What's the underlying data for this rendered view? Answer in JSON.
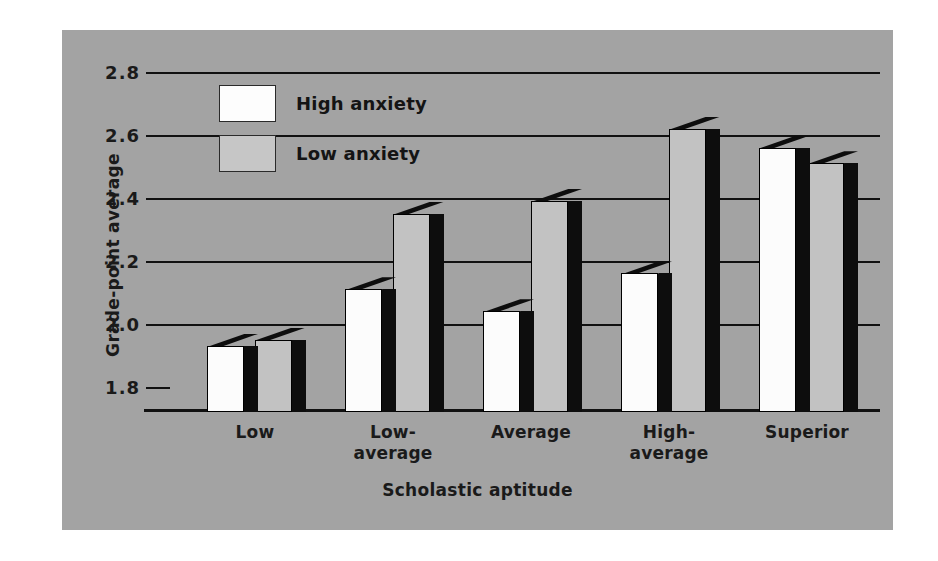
{
  "chart_data": {
    "type": "bar",
    "title": "",
    "xlabel": "Scholastic aptitude",
    "ylabel": "Grade-point average",
    "categories": [
      "Low",
      "Low-\naverage",
      "Average",
      "High-\naverage",
      "Superior"
    ],
    "series": [
      {
        "name": "High anxiety",
        "color": "#fcfcfc",
        "values": [
          1.93,
          2.11,
          2.04,
          2.16,
          2.56
        ]
      },
      {
        "name": "Low anxiety",
        "color": "#c2c2c2",
        "values": [
          1.95,
          2.35,
          2.39,
          2.62,
          2.51
        ]
      }
    ],
    "yticks": [
      "1.8",
      "2.0",
      "2.2",
      "2.4",
      "2.6",
      "2.8"
    ],
    "ytick_values": [
      1.8,
      2.0,
      2.2,
      2.4,
      2.6,
      2.8
    ],
    "ylim": [
      1.72,
      2.8
    ],
    "grid": true,
    "legend_position": "upper-left-inside",
    "background_color": "#a3a3a3"
  },
  "legend": {
    "items": [
      {
        "label": "High anxiety"
      },
      {
        "label": "Low anxiety"
      }
    ]
  }
}
